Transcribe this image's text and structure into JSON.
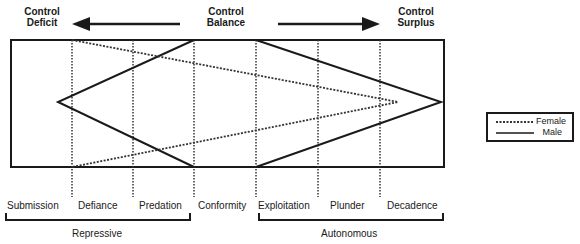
{
  "header": {
    "left": {
      "line1": "Control",
      "line2": "Deficit"
    },
    "center": {
      "line1": "Control",
      "line2": "Balance"
    },
    "right": {
      "line1": "Control",
      "line2": "Surplus"
    }
  },
  "categories": [
    "Submission",
    "Defiance",
    "Predation",
    "Conformity",
    "Exploitation",
    "Plunder",
    "Decadence"
  ],
  "groups": {
    "repressive": "Repressive",
    "autonomous": "Autonomous"
  },
  "legend": {
    "female": "Female",
    "male": "Male"
  },
  "colors": {
    "line": "#1a1a1a",
    "background": "#ffffff"
  }
}
